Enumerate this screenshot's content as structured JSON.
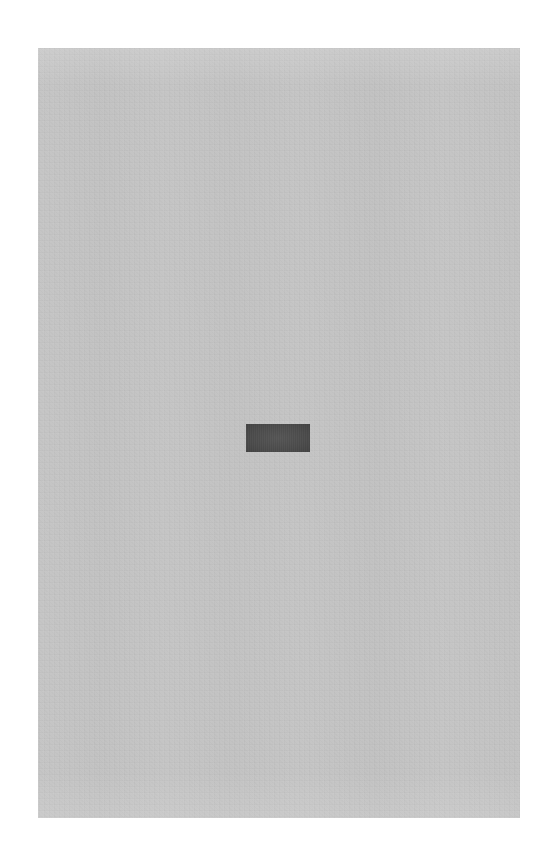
{
  "page": {
    "background_color": "#ffffff",
    "width": 541,
    "height": 862
  },
  "panel": {
    "name": "content-panel",
    "background_color": "#c3c3c3",
    "x": 38,
    "y": 48,
    "width": 482,
    "height": 770,
    "text": "",
    "has_content": false
  },
  "placeholder_block": {
    "name": "placeholder-block",
    "color": "#4d4d4d",
    "x": 246,
    "y": 424,
    "width": 64,
    "height": 28,
    "label": ""
  }
}
